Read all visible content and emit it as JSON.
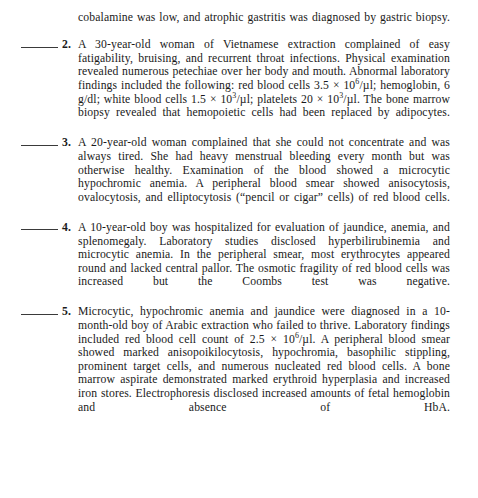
{
  "document": {
    "type": "textbook-review-questions",
    "continued_paragraph": "cobalamine was low, and atrophic gastritis was diagnosed by gastric biopsy.",
    "blank_rule_label": "_____",
    "questions": [
      {
        "number": "2.",
        "segments": [
          {
            "t": "text",
            "v": "A 30-year-old woman of Vietnamese extraction complained of easy fatigability, bruising, and recurrent throat infections. Physical examination revealed numerous petechiae over her body and mouth. Abnormal laboratory findings included the following: red blood cells 3.5 "
          },
          {
            "t": "text",
            "v": "× 10"
          },
          {
            "t": "sup",
            "v": "6"
          },
          {
            "t": "text",
            "v": "/µl; hemoglobin, 6 g/dl; white blood cells 1.5 × 10"
          },
          {
            "t": "sup",
            "v": "3"
          },
          {
            "t": "text",
            "v": "/µl; platelets 20 × 10"
          },
          {
            "t": "sup",
            "v": "3"
          },
          {
            "t": "text",
            "v": "/µl. The bone marrow biopsy revealed that hemopoietic cells had been replaced by adipocytes."
          }
        ]
      },
      {
        "number": "3.",
        "segments": [
          {
            "t": "text",
            "v": "A 20-year-old woman complained that she could not concentrate and was always tired. She had heavy menstrual bleeding every month but was otherwise healthy. Examination of the blood showed a microcytic hypochromic anemia. A peripheral blood smear showed anisocytosis, ovalocytosis, and elliptocytosis (“pencil or cigar” cells) of red blood cells."
          }
        ]
      },
      {
        "number": "4.",
        "segments": [
          {
            "t": "text",
            "v": "A 10-year-old boy was hospitalized for evaluation of jaundice, anemia, and splenomegaly. Laboratory studies disclosed hyperbilirubinemia and microcytic anemia. In the peripheral smear, most erythrocytes appeared round and lacked central pallor. The osmotic fragility of red blood cells was increased but the Coombs test was negative."
          }
        ]
      },
      {
        "number": "5.",
        "segments": [
          {
            "t": "text",
            "v": "Microcytic, hypochromic anemia and jaundice were diagnosed in a 10-month-old boy of Arabic extraction who failed to thrive. Laboratory findings included red blood cell count of 2.5 × 10"
          },
          {
            "t": "sup",
            "v": "6"
          },
          {
            "t": "text",
            "v": "/µl. A peripheral blood smear showed marked anisopoikilocytosis, hypochromia, basophilic stippling, prominent target cells, and numerous nucleated red blood cells. A bone marrow aspirate demonstrated marked erythroid hyperplasia and increased iron stores. Electrophoresis disclosed increased amounts of fetal hemoglobin and absence of HbA."
          }
        ]
      }
    ]
  }
}
